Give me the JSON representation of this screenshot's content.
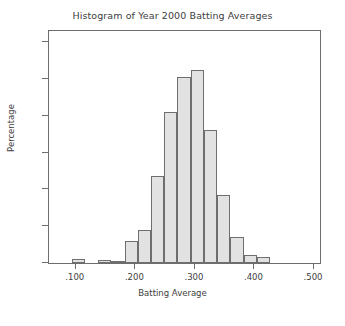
{
  "chart_data": {
    "type": "bar",
    "title": "Histogram of Year 2000 Batting Averages",
    "xlabel": "Batting Average",
    "ylabel": "Percentage",
    "xlim": [
      0.055,
      0.51
    ],
    "ylim": [
      0,
      12.6
    ],
    "xtick_labels": [
      ".100",
      ".200",
      ".300",
      ".400",
      ".500"
    ],
    "xtick_values": [
      0.1,
      0.2,
      0.3,
      0.4,
      0.5
    ],
    "ytick_labels": [
      "0",
      "2",
      "4",
      "6",
      "8",
      "10",
      "12"
    ],
    "ytick_values": [
      0,
      2,
      4,
      6,
      8,
      10,
      12
    ],
    "grid": false,
    "legend": "none",
    "bin_width": 0.0222,
    "bar_fill_color": "#e2e2e2",
    "bar_edge_color": "#6e6e6e",
    "axis_color": "#6d6d6d",
    "text_color": "#3d3d3d",
    "background_color": "#ffffff",
    "bins": [
      {
        "x0": 0.093,
        "x1": 0.1152,
        "value": 0.2
      },
      {
        "x0": 0.1374,
        "x1": 0.1596,
        "value": 0.15
      },
      {
        "x0": 0.1596,
        "x1": 0.1818,
        "value": 0.1
      },
      {
        "x0": 0.1818,
        "x1": 0.204,
        "value": 1.2
      },
      {
        "x0": 0.204,
        "x1": 0.2262,
        "value": 1.8
      },
      {
        "x0": 0.2262,
        "x1": 0.2484,
        "value": 4.7
      },
      {
        "x0": 0.2484,
        "x1": 0.2706,
        "value": 8.2
      },
      {
        "x0": 0.2706,
        "x1": 0.2928,
        "value": 10.1
      },
      {
        "x0": 0.2928,
        "x1": 0.315,
        "value": 10.5
      },
      {
        "x0": 0.315,
        "x1": 0.3372,
        "value": 7.2
      },
      {
        "x0": 0.3372,
        "x1": 0.3594,
        "value": 3.7
      },
      {
        "x0": 0.3594,
        "x1": 0.3816,
        "value": 1.4
      },
      {
        "x0": 0.3816,
        "x1": 0.4038,
        "value": 0.45
      },
      {
        "x0": 0.4038,
        "x1": 0.426,
        "value": 0.35
      }
    ]
  }
}
